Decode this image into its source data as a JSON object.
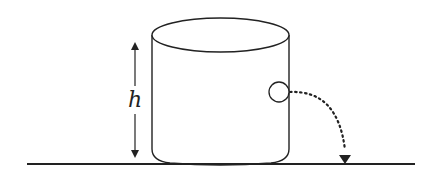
{
  "diagram": {
    "type": "physics-illustration",
    "labels": {
      "height": "h"
    },
    "elements": {
      "ground_line": {
        "x1": 27,
        "x2": 415,
        "y": 164
      },
      "container": {
        "left": 152,
        "right": 289,
        "top_center_y": 35,
        "ellipse_ry": 17,
        "bottom_y": 164
      },
      "height_arrow": {
        "x": 135,
        "y_top": 38,
        "y_bottom": 162
      },
      "hole": {
        "cx": 279,
        "cy": 92,
        "r": 10
      },
      "jet_path": {
        "start": [
          289,
          92
        ],
        "end": [
          345,
          160
        ],
        "style": "dotted"
      }
    },
    "colors": {
      "stroke": "#222222",
      "background": "#ffffff"
    }
  }
}
